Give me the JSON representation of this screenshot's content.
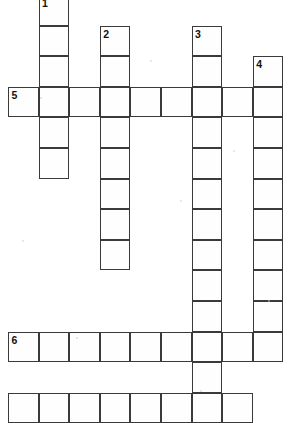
{
  "puzzle": {
    "title": "Crossword Puzzle Grid",
    "type": "crossword",
    "canvas": {
      "width": 293,
      "height": 416
    },
    "grid": {
      "cell_size": 30.6,
      "origin_x": 8,
      "origin_y": -5,
      "line_color": "#3a3a3a",
      "cell_fill": "#fefefe",
      "background": "#ffffff"
    },
    "clue_numbers": [
      {
        "label": "1",
        "col": 1,
        "row": 0
      },
      {
        "label": "2",
        "col": 3,
        "row": 1
      },
      {
        "label": "3",
        "col": 6,
        "row": 1
      },
      {
        "label": "4",
        "col": 8,
        "row": 2
      },
      {
        "label": "5",
        "col": 0,
        "row": 3
      },
      {
        "label": "6",
        "col": 0,
        "row": 11
      }
    ],
    "entries": [
      {
        "number": "1",
        "direction": "down",
        "col": 1,
        "row_start": 0,
        "length": 5,
        "cells": [
          {
            "col": 1,
            "row": 0
          },
          {
            "col": 1,
            "row": 1
          },
          {
            "col": 1,
            "row": 2
          },
          {
            "col": 1,
            "row": 3
          },
          {
            "col": 1,
            "row": 4
          },
          {
            "col": 1,
            "row": 5
          }
        ]
      },
      {
        "number": "2",
        "direction": "down",
        "col": 3,
        "row_start": 1,
        "length": 8,
        "cells": [
          {
            "col": 3,
            "row": 1
          },
          {
            "col": 3,
            "row": 2
          },
          {
            "col": 3,
            "row": 3
          },
          {
            "col": 3,
            "row": 4
          },
          {
            "col": 3,
            "row": 5
          },
          {
            "col": 3,
            "row": 6
          },
          {
            "col": 3,
            "row": 7
          },
          {
            "col": 3,
            "row": 8
          }
        ]
      },
      {
        "number": "3",
        "direction": "down",
        "col": 6,
        "row_start": 1,
        "length": 13,
        "cells": [
          {
            "col": 6,
            "row": 1
          },
          {
            "col": 6,
            "row": 2
          },
          {
            "col": 6,
            "row": 3
          },
          {
            "col": 6,
            "row": 4
          },
          {
            "col": 6,
            "row": 5
          },
          {
            "col": 6,
            "row": 6
          },
          {
            "col": 6,
            "row": 7
          },
          {
            "col": 6,
            "row": 8
          },
          {
            "col": 6,
            "row": 9
          },
          {
            "col": 6,
            "row": 10
          },
          {
            "col": 6,
            "row": 11
          },
          {
            "col": 6,
            "row": 12
          },
          {
            "col": 6,
            "row": 13
          }
        ]
      },
      {
        "number": "4",
        "direction": "down",
        "col": 8,
        "row_start": 2,
        "length": 10,
        "cells": [
          {
            "col": 8,
            "row": 2
          },
          {
            "col": 8,
            "row": 3
          },
          {
            "col": 8,
            "row": 4
          },
          {
            "col": 8,
            "row": 5
          },
          {
            "col": 8,
            "row": 6
          },
          {
            "col": 8,
            "row": 7
          },
          {
            "col": 8,
            "row": 8
          },
          {
            "col": 8,
            "row": 9
          },
          {
            "col": 8,
            "row": 10
          },
          {
            "col": 8,
            "row": 11
          }
        ]
      },
      {
        "number": "5",
        "direction": "across",
        "row": 3,
        "col_start": 0,
        "length": 9,
        "cells": [
          {
            "col": 0,
            "row": 3
          },
          {
            "col": 1,
            "row": 3
          },
          {
            "col": 2,
            "row": 3
          },
          {
            "col": 3,
            "row": 3
          },
          {
            "col": 4,
            "row": 3
          },
          {
            "col": 5,
            "row": 3
          },
          {
            "col": 6,
            "row": 3
          },
          {
            "col": 7,
            "row": 3
          },
          {
            "col": 8,
            "row": 3
          }
        ]
      },
      {
        "number": "6",
        "direction": "across",
        "row": 11,
        "col_start": 0,
        "length": 8,
        "cells": [
          {
            "col": 0,
            "row": 11
          },
          {
            "col": 1,
            "row": 11
          },
          {
            "col": 2,
            "row": 11
          },
          {
            "col": 3,
            "row": 11
          },
          {
            "col": 4,
            "row": 11
          },
          {
            "col": 5,
            "row": 11
          },
          {
            "col": 6,
            "row": 11
          },
          {
            "col": 7,
            "row": 11
          }
        ]
      },
      {
        "number": "",
        "direction": "across",
        "row": 13,
        "col_start": 0,
        "length": 8,
        "clipped": true,
        "cells": [
          {
            "col": 0,
            "row": 13
          },
          {
            "col": 1,
            "row": 13
          },
          {
            "col": 2,
            "row": 13
          },
          {
            "col": 3,
            "row": 13
          },
          {
            "col": 4,
            "row": 13
          },
          {
            "col": 5,
            "row": 13
          },
          {
            "col": 6,
            "row": 13
          },
          {
            "col": 7,
            "row": 13
          }
        ]
      }
    ],
    "speckles": [
      {
        "x": 76,
        "y": 337
      },
      {
        "x": 233,
        "y": 150
      },
      {
        "x": 40,
        "y": 97
      },
      {
        "x": 268,
        "y": 300
      },
      {
        "x": 150,
        "y": 60
      },
      {
        "x": 200,
        "y": 390
      },
      {
        "x": 22,
        "y": 240
      },
      {
        "x": 180,
        "y": 200
      }
    ]
  }
}
